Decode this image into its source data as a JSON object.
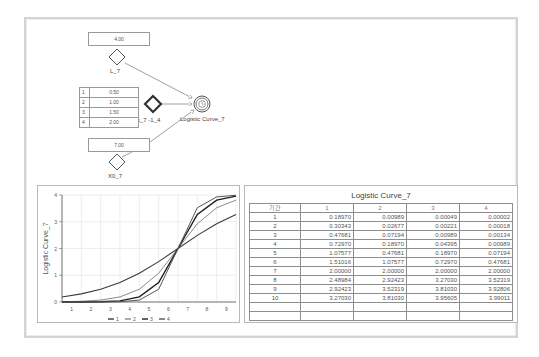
{
  "canvas": {
    "inputs": {
      "L_7": {
        "value": "4.00",
        "label": "L_7"
      },
      "X0_7": {
        "value": "7.00",
        "label": "X0_7"
      }
    },
    "k_table": {
      "label": "k_7 -1_4",
      "rows": [
        {
          "idx": "1",
          "value": "0.50"
        },
        {
          "idx": "2",
          "value": "1.00"
        },
        {
          "idx": "3",
          "value": "1.50"
        },
        {
          "idx": "4",
          "value": "2.00"
        }
      ]
    },
    "output_node": {
      "label": "Logistic Curve_7",
      "icon": "clock-icon"
    }
  },
  "chart_data": {
    "type": "line",
    "title": "",
    "xlabel": "",
    "ylabel": "Logistic Curve_7",
    "x": [
      1,
      2,
      3,
      4,
      5,
      6,
      7,
      8,
      9,
      10
    ],
    "xticks": [
      "1",
      "2",
      "3",
      "4",
      "5",
      "6",
      "7",
      "8",
      "9"
    ],
    "yticks": [
      "0",
      "1",
      "2",
      "3",
      "4"
    ],
    "ylim": [
      0,
      4
    ],
    "grid": true,
    "legend_position": "bottom",
    "series": [
      {
        "name": "1",
        "color": "#3a3a3a",
        "values": [
          0.1897,
          0.30343,
          0.47681,
          0.7297,
          1.07577,
          1.51016,
          2.0,
          2.48984,
          2.92423,
          3.2703
        ]
      },
      {
        "name": "2",
        "color": "#8a8a8a",
        "values": [
          0.00989,
          0.02677,
          0.07194,
          0.1897,
          0.47681,
          1.07577,
          2.0,
          2.92423,
          3.52319,
          3.8103
        ]
      },
      {
        "name": "3",
        "color": "#1e1e1e",
        "values": [
          0.00049,
          0.00221,
          0.00989,
          0.04395,
          0.1897,
          0.7297,
          2.0,
          3.2703,
          3.8103,
          3.95605
        ]
      },
      {
        "name": "4",
        "color": "#555555",
        "values": [
          2e-05,
          0.00018,
          0.00134,
          0.00989,
          0.07194,
          0.47681,
          2.0,
          3.52319,
          3.92806,
          3.99011
        ]
      }
    ]
  },
  "result_table": {
    "title": "Logistic Curve_7",
    "headers": [
      "기간",
      "1",
      "2",
      "3",
      "4"
    ],
    "rows": [
      [
        "1",
        "0.18970",
        "0.00989",
        "0.00049",
        "0.00002"
      ],
      [
        "2",
        "0.30343",
        "0.02677",
        "0.00221",
        "0.00018"
      ],
      [
        "3",
        "0.47681",
        "0.07194",
        "0.00989",
        "0.00134"
      ],
      [
        "4",
        "0.72970",
        "0.18970",
        "0.04395",
        "0.00989"
      ],
      [
        "5",
        "1.07577",
        "0.47681",
        "0.18970",
        "0.07194"
      ],
      [
        "6",
        "1.51016",
        "1.07577",
        "0.72970",
        "0.47681"
      ],
      [
        "7",
        "2.00000",
        "2.00000",
        "2.00000",
        "2.00000"
      ],
      [
        "8",
        "2.48984",
        "2.92423",
        "3.27030",
        "3.52319"
      ],
      [
        "9",
        "2.92423",
        "3.52319",
        "3.81030",
        "3.92806"
      ],
      [
        "10",
        "3.27030",
        "3.81030",
        "3.95605",
        "3.99011"
      ],
      [
        "",
        "",
        "",
        "",
        ""
      ],
      [
        "",
        "",
        "",
        "",
        ""
      ]
    ]
  }
}
